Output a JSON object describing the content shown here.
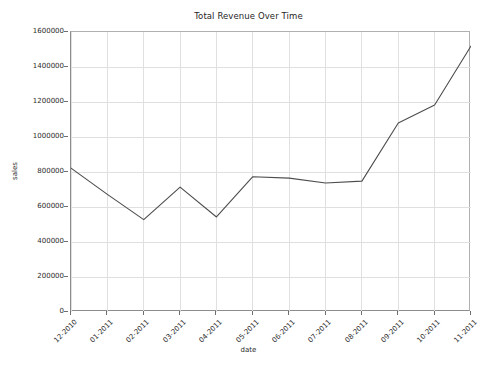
{
  "chart_data": {
    "type": "line",
    "title": "Total Revenue Over Time",
    "xlabel": "date",
    "ylabel": "sales",
    "categories": [
      "12-2010",
      "01-2011",
      "02-2011",
      "03-2011",
      "04-2011",
      "05-2011",
      "06-2011",
      "07-2011",
      "08-2011",
      "09-2011",
      "10-2011",
      "11-2011"
    ],
    "values": [
      822000,
      672000,
      528000,
      714000,
      543000,
      773000,
      765000,
      737000,
      748000,
      1080000,
      1183000,
      1520000
    ],
    "series": [
      {
        "name": "sales",
        "values": [
          822000,
          672000,
          528000,
          714000,
          543000,
          773000,
          765000,
          737000,
          748000,
          1080000,
          1183000,
          1520000
        ]
      }
    ],
    "ylim": [
      0,
      1600000
    ],
    "yticks": [
      0,
      200000,
      400000,
      600000,
      800000,
      1000000,
      1200000,
      1400000,
      1600000
    ],
    "ytick_labels": [
      "0",
      "200000",
      "400000",
      "600000",
      "800000",
      "1000000",
      "1200000",
      "1400000",
      "1600000"
    ],
    "grid": true,
    "legend": false,
    "line_color": "#4d4d4d",
    "grid_color": "#e0e0e0",
    "axis_color": "#8c8c8c",
    "background_color": "#ffffff"
  }
}
